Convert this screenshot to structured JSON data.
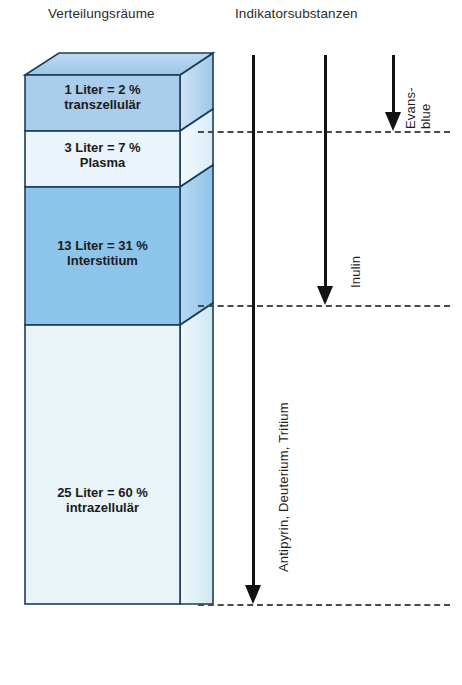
{
  "headers": {
    "left": "Verteilungsräume",
    "right": "Indikatorsubstanzen"
  },
  "compartments": [
    {
      "id": "transzellulaer",
      "value_label": "1 Liter = 2 %",
      "name_label": "transzellulär",
      "liters": 1,
      "percent": 2,
      "color": "#a9cdea"
    },
    {
      "id": "plasma",
      "value_label": "3 Liter = 7 %",
      "name_label": "Plasma",
      "liters": 3,
      "percent": 7,
      "color": "#eaf4fa"
    },
    {
      "id": "interstitium",
      "value_label": "13 Liter = 31 %",
      "name_label": "Interstitium",
      "liters": 13,
      "percent": 31,
      "color": "#8cc4ea"
    },
    {
      "id": "intrazellulaer",
      "value_label": "25 Liter = 60 %",
      "name_label": "intrazellulär",
      "liters": 25,
      "percent": 60,
      "color": "#e8f4f8"
    }
  ],
  "indicators": [
    {
      "id": "antipyrin",
      "label": "Antipyrin, Deuterium, Tritium",
      "reaches": "intrazellulär"
    },
    {
      "id": "inulin",
      "label": "Inulin",
      "reaches": "Interstitium"
    },
    {
      "id": "evans-blue",
      "label_line1": "Evans-",
      "label_line2": "blue",
      "reaches": "Plasma"
    }
  ],
  "colors": {
    "outline": "#1c3d5a",
    "arrow": "#121212",
    "dash": "#4a4a4a",
    "text": "#1a1a1a"
  }
}
